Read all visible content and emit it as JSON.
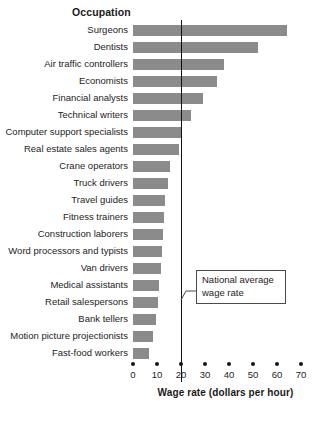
{
  "chart_data": {
    "type": "bar",
    "orientation": "horizontal",
    "title": "",
    "xlabel": "Wage rate (dollars per hour)",
    "ylabel": "Occupation",
    "xlim": [
      0,
      70
    ],
    "xticks": [
      0,
      10,
      20,
      30,
      40,
      50,
      60,
      70
    ],
    "xtick_labels": [
      "0",
      "10",
      "20",
      "30",
      "40",
      "50",
      "60",
      "70"
    ],
    "grid": false,
    "legend": null,
    "bar_color": "#8b8b8b",
    "categories": [
      "Surgeons",
      "Dentists",
      "Air traffic controllers",
      "Economists",
      "Financial analysts",
      "Technical writers",
      "Computer support specialists",
      "Real estate sales agents",
      "Crane operators",
      "Truck drivers",
      "Travel guides",
      "Fitness trainers",
      "Construction laborers",
      "Word processors and typists",
      "Van drivers",
      "Medical assistants",
      "Retail salespersons",
      "Bank tellers",
      "Motion picture projectionists",
      "Fast-food workers"
    ],
    "values": [
      64,
      52,
      38,
      35,
      29,
      24,
      20.5,
      19,
      15.5,
      14.5,
      13.5,
      13,
      12.5,
      12,
      11.5,
      11,
      10.5,
      9.5,
      8.5,
      6.5
    ],
    "annotations": [
      {
        "name": "national-average-wage-rate",
        "text_line1": "National average",
        "text_line2": "wage rate",
        "reference_value": 20,
        "kind": "vertical-reference-line"
      }
    ]
  }
}
